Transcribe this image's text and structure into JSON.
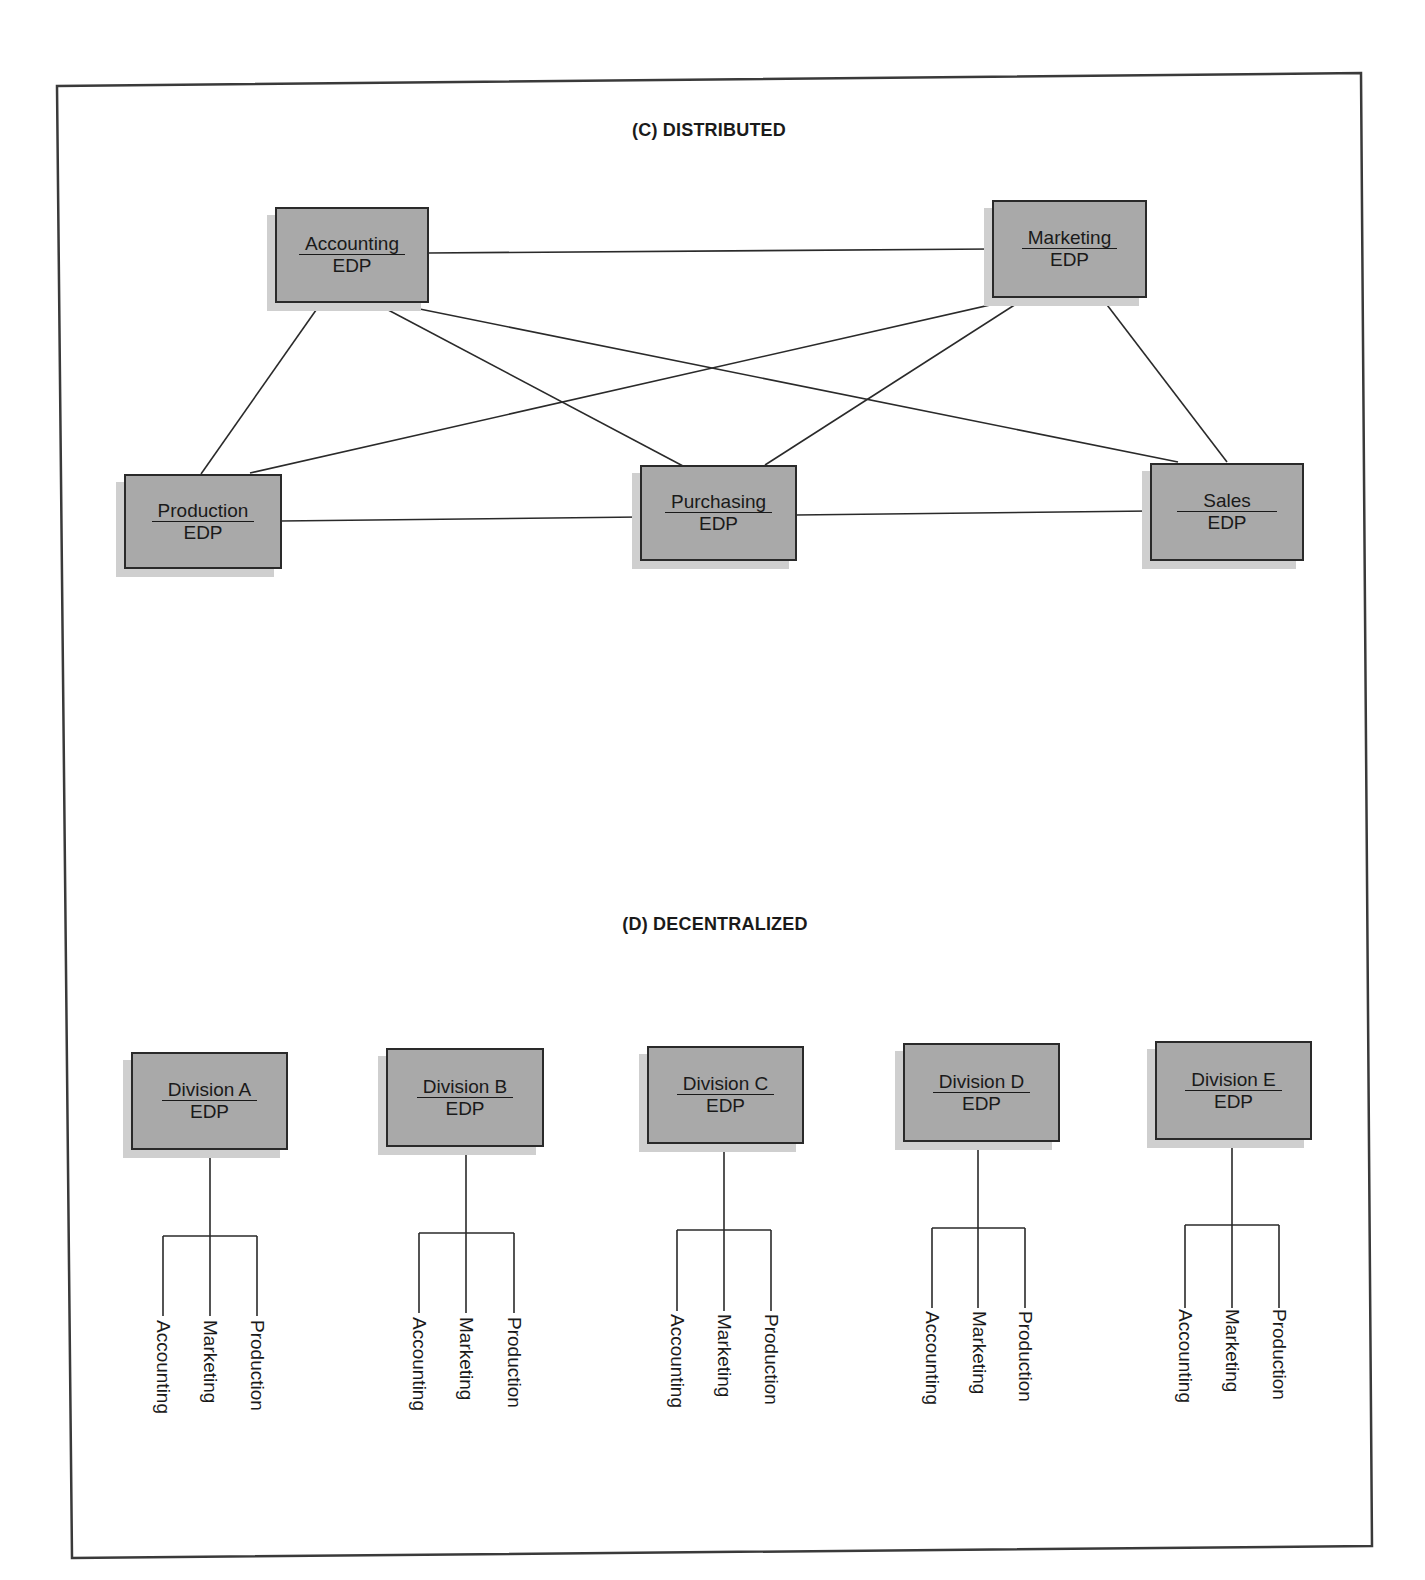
{
  "frame_color": "#3a3a3a",
  "box_fill": "#a9a9a9",
  "distributed": {
    "title": "(C) DISTRIBUTED",
    "nodes": [
      {
        "id": "accounting",
        "name": "Accounting",
        "sub": "EDP"
      },
      {
        "id": "marketing",
        "name": "Marketing",
        "sub": "EDP"
      },
      {
        "id": "production",
        "name": "Production",
        "sub": "EDP"
      },
      {
        "id": "purchasing",
        "name": "Purchasing",
        "sub": "EDP"
      },
      {
        "id": "sales",
        "name": "Sales",
        "sub": "EDP"
      }
    ],
    "edges": [
      [
        "Accounting",
        "Marketing"
      ],
      [
        "Accounting",
        "Production"
      ],
      [
        "Accounting",
        "Purchasing"
      ],
      [
        "Accounting",
        "Sales"
      ],
      [
        "Marketing",
        "Production"
      ],
      [
        "Marketing",
        "Purchasing"
      ],
      [
        "Marketing",
        "Sales"
      ],
      [
        "Production",
        "Purchasing"
      ],
      [
        "Purchasing",
        "Sales"
      ]
    ]
  },
  "decentralized": {
    "title": "(D) DECENTRALIZED",
    "divisions": [
      {
        "name": "Division A",
        "sub": "EDP",
        "children": [
          "Accounting",
          "Marketing",
          "Production"
        ]
      },
      {
        "name": "Division B",
        "sub": "EDP",
        "children": [
          "Accounting",
          "Marketing",
          "Production"
        ]
      },
      {
        "name": "Division C",
        "sub": "EDP",
        "children": [
          "Accounting",
          "Marketing",
          "Production"
        ]
      },
      {
        "name": "Division D",
        "sub": "EDP",
        "children": [
          "Accounting",
          "Marketing",
          "Production"
        ]
      },
      {
        "name": "Division E",
        "sub": "EDP",
        "children": [
          "Accounting",
          "Marketing",
          "Production"
        ]
      }
    ]
  }
}
